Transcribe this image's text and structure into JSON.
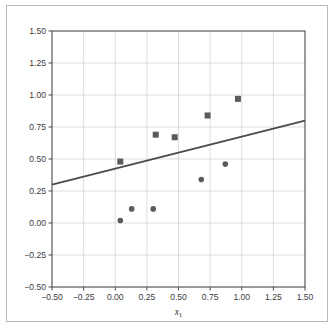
{
  "figure": {
    "background_color": "#ffffff",
    "frame_color": "#b9b9b9",
    "axis_color": "#4a4a4a",
    "grid_color": "#cfcfcf"
  },
  "chart_data": {
    "type": "scatter",
    "title": "",
    "xlabel": "x₁",
    "ylabel": "",
    "xlim": [
      -0.5,
      1.5
    ],
    "ylim": [
      -0.5,
      1.5
    ],
    "grid": true,
    "legend": "none",
    "xticks": [
      -0.5,
      -0.25,
      0,
      0.25,
      0.5,
      0.75,
      1,
      1.25,
      1.5
    ],
    "yticks": [
      -0.5,
      -0.25,
      0,
      0.25,
      0.5,
      0.75,
      1,
      1.25,
      1.5
    ],
    "xticklabels": [
      "-0.50",
      "-0.25",
      "0.00",
      "0.25",
      "0.50",
      "0.75",
      "1.00",
      "1.25",
      "1.50"
    ],
    "yticklabels": [
      "-0.50",
      "-0.25",
      "0.00",
      "0.25",
      "0.50",
      "0.75",
      "1.00",
      "1.25",
      "1.50"
    ],
    "series": [
      {
        "name": "class-1-squares",
        "marker": "square",
        "color": "#5a5a5a",
        "marker_size": 6,
        "x": [
          0.04,
          0.32,
          0.47,
          0.73,
          0.97
        ],
        "y": [
          0.48,
          0.69,
          0.67,
          0.84,
          0.97
        ]
      },
      {
        "name": "class-0-circles",
        "marker": "circle",
        "color": "#5a5a5a",
        "marker_size": 5.6,
        "x": [
          0.04,
          0.13,
          0.3,
          0.68,
          0.87
        ],
        "y": [
          0.02,
          0.11,
          0.11,
          0.34,
          0.46
        ]
      }
    ],
    "fit_line": {
      "name": "regression-line",
      "color": "#4a4a4a",
      "width": 1.6,
      "slope": 0.25,
      "intercept": 0.425,
      "x_start": -0.5,
      "y_start": 0.3,
      "x_end": 1.5,
      "y_end": 0.8
    }
  }
}
